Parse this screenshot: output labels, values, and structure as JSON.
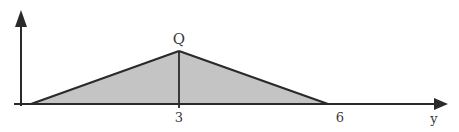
{
  "diagram": {
    "type": "triangular distribution",
    "axis_label": "y",
    "apex_label": "Q",
    "ticks": [
      {
        "label": "3",
        "value": 3
      },
      {
        "label": "6",
        "value": 6
      }
    ],
    "shape": {
      "vertices": [
        [
          0,
          0
        ],
        [
          3,
          "Q"
        ],
        [
          6,
          0
        ]
      ],
      "fill": "#c4c4c4",
      "stroke": "#2a2a2a"
    }
  }
}
